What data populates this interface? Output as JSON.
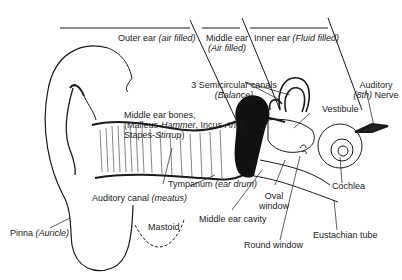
{
  "diagram": {
    "regions": [
      {
        "name": "Outer ear",
        "note": "air filled"
      },
      {
        "name": "Middle ear",
        "note": "Air filled"
      },
      {
        "name": "Inner ear",
        "note": "Fluid filled"
      }
    ],
    "labels": {
      "outer_ear": {
        "main": "Outer ear ",
        "italic": "(air filled)"
      },
      "middle_ear": {
        "main": "Middle ear",
        "italic": "(Air filled)"
      },
      "inner_ear": {
        "main": "Inner ear ",
        "italic": "(Fluid filled)"
      },
      "semicircular": {
        "main": "3 Semicircular canals",
        "italic": "(Balance)"
      },
      "auditory_nerve": {
        "line1": "Auditory",
        "italic": "(8th)",
        "rest": " Nerve"
      },
      "bones": {
        "line1": "Middle ear bones,",
        "p1": "(Malleus-",
        "i1": "Hammer",
        "p2": ", Incus-",
        "i2": "Anvil",
        "p3": ",",
        "p4": "Stapes-",
        "i3": "Stirrup",
        "p5": ")"
      },
      "vestibule": "Vestibule",
      "cochlea": "Cochlea",
      "tympanum": {
        "main": "Tympanum ",
        "italic": "(ear drum)"
      },
      "auditory_canal": {
        "main": "Auditory canal ",
        "italic": "(meatus)"
      },
      "oval_window": {
        "line1": "Oval",
        "line2": "window"
      },
      "middle_ear_cavity": "Middle ear cavity",
      "eustachian": "Eustachian tube",
      "round_window": "Round window",
      "mastoid": "Mastoid",
      "pinna": {
        "main": "Pinna ",
        "italic": "(Auricle)"
      }
    }
  }
}
